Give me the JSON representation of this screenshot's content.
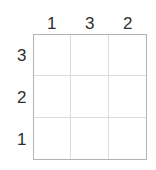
{
  "puzzle": {
    "type": "grid-puzzle",
    "rows": 3,
    "columns": 3,
    "colors": {
      "background": "#ffffff",
      "outer_border": "#b3b3b3",
      "inner_gridline": "#dcdcdc",
      "text": "#2e2e2e"
    },
    "column_clues": [
      {
        "label": "1"
      },
      {
        "label": "3"
      },
      {
        "label": "2"
      }
    ],
    "row_clues": [
      {
        "label": "3"
      },
      {
        "label": "2"
      },
      {
        "label": "1"
      }
    ],
    "cells": [
      [
        {
          "value": ""
        },
        {
          "value": ""
        },
        {
          "value": ""
        }
      ],
      [
        {
          "value": ""
        },
        {
          "value": ""
        },
        {
          "value": ""
        }
      ],
      [
        {
          "value": ""
        },
        {
          "value": ""
        },
        {
          "value": ""
        }
      ]
    ]
  }
}
